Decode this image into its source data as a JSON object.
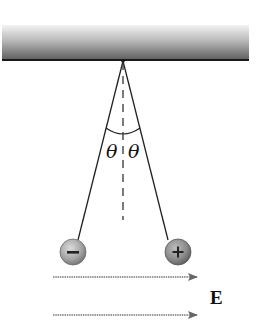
{
  "figure": {
    "ceiling": {
      "label": "support-bar"
    },
    "angle_labels": {
      "left": "θ",
      "right": "θ"
    },
    "spheres": [
      {
        "charge": "negative",
        "sign": "−",
        "position": "left"
      },
      {
        "charge": "positive",
        "sign": "+",
        "position": "right"
      }
    ],
    "field": {
      "label": "E",
      "direction": "right",
      "arrow_count": 2
    },
    "colors": {
      "ceiling_top": "#f2f2f2",
      "ceiling_bottom": "#6a6a6a",
      "ceiling_edge": "#1a1a1a",
      "string": "#222222",
      "sphere_negative": "#a8a8a8",
      "sphere_positive": "#8a8a8a",
      "arrow": "#777777"
    }
  }
}
